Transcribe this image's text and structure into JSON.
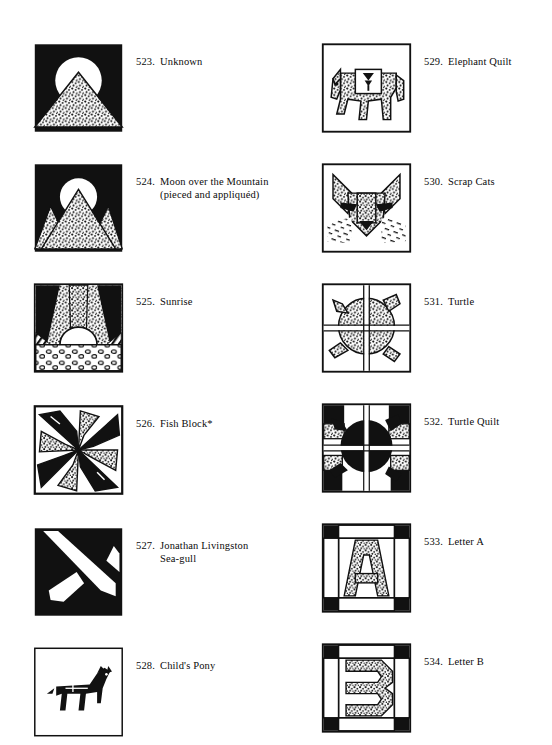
{
  "page": {
    "kind": "quilt-block-pattern-catalog-page",
    "columns": 2
  },
  "left_column": {
    "entries": [
      {
        "number": "523.",
        "title": "Unknown",
        "figure": "moon-over-mountain-single",
        "fill_colors": {
          "background": "#111111",
          "moon": "#ffffff",
          "mountain": "stipple"
        }
      },
      {
        "number": "524.",
        "title": "Moon over the Mountain (pieced and appliquéd)",
        "title_line1": "Moon over the Mountain",
        "title_line2": "(pieced and appliquéd)",
        "figure": "moon-over-mountain-triple",
        "fill_colors": {
          "background": "#111111",
          "moon": "#ffffff",
          "mountain": "stipple"
        }
      },
      {
        "number": "525.",
        "title": "Sunrise",
        "figure": "sunrise",
        "fill_colors": {
          "sky": "stipple",
          "rays": "#111111",
          "sun": "#ffffff",
          "ground": "pebble"
        }
      },
      {
        "number": "526.",
        "title": "Fish Block*",
        "figure": "fish-block-pinwheel",
        "fill_colors": {
          "fish_dark": "#111111",
          "fish_light": "stipple"
        }
      },
      {
        "number": "527.",
        "title": "Jonathan Livingston Sea-gull",
        "title_line1": "Jonathan Livingston Sea-",
        "title_line2": "gull",
        "figure": "seagull",
        "fill_colors": {
          "background": "#111111",
          "gull": "#ffffff"
        }
      },
      {
        "number": "528.",
        "title": "Child's Pony",
        "figure": "childs-pony",
        "fill_colors": {
          "background": "#ffffff",
          "pony_outline": "#111111"
        }
      }
    ]
  },
  "right_column": {
    "entries": [
      {
        "number": "529.",
        "title": "Elephant Quilt",
        "figure": "elephant",
        "fill_colors": {
          "body": "stipple",
          "blanket": "#ffffff",
          "bell": "#111111"
        }
      },
      {
        "number": "530.",
        "title": "Scrap Cats",
        "figure": "scrap-cat-face",
        "fill_colors": {
          "face": "stipple",
          "eyes": "#111111",
          "nose": "#111111",
          "whiskers": "#111111"
        }
      },
      {
        "number": "531.",
        "title": "Turtle",
        "figure": "turtle",
        "fill_colors": {
          "shell": "stipple",
          "background": "#ffffff",
          "lines": "#111111"
        }
      },
      {
        "number": "532.",
        "title": "Turtle Quilt",
        "figure": "turtle-quilt",
        "fill_colors": {
          "shell": "#111111",
          "background": "#ffffff",
          "corner": "stipple"
        }
      },
      {
        "number": "533.",
        "title": "Letter A",
        "figure": "letter-a-block",
        "letter": "A",
        "fill_colors": {
          "letter": "stipple",
          "corners": "#111111",
          "sashing": "#ffffff"
        }
      },
      {
        "number": "534.",
        "title": "Letter B",
        "figure": "letter-b-block",
        "letter": "B",
        "fill_colors": {
          "letter": "stipple",
          "corners": "#111111",
          "sashing": "#ffffff"
        }
      }
    ]
  }
}
